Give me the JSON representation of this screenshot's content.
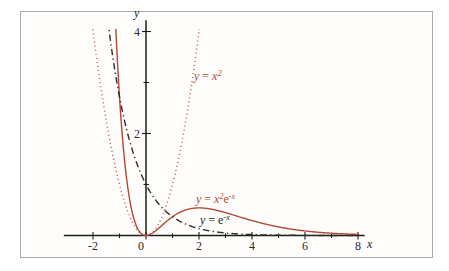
{
  "figure": {
    "background": "#ffffff",
    "frame_border_color": "#ababab",
    "axis_color": "#1d1d1b",
    "text_color": "#2b2b2b"
  },
  "chart_data": {
    "type": "line",
    "title": "",
    "xlabel": "x",
    "ylabel": "y",
    "x_axis_span": [
      -3.1,
      8.25
    ],
    "y_axis_span": [
      0,
      4.22
    ],
    "grid": false,
    "legend_position": "labels-on-curves",
    "x_ticks_major": [
      -2,
      0,
      2,
      4,
      6,
      8
    ],
    "x_tick_labels": [
      "-2",
      "0",
      "2",
      "4",
      "6",
      "8"
    ],
    "x_ticks_minor": [
      -1,
      1,
      3,
      5,
      7
    ],
    "y_ticks_major": [
      2,
      4
    ],
    "y_tick_labels": [
      "2",
      "4"
    ],
    "y_ticks_minor": [
      1,
      3
    ],
    "series": [
      {
        "name": "y = x^2",
        "formula": "x^2",
        "style": "dotted",
        "color": "#c05a40",
        "domain": [
          -2.03,
          2.03
        ],
        "label": {
          "segments": [
            {
              "text": "y",
              "italic": true
            },
            {
              "text": " = ",
              "italic": false
            },
            {
              "text": "x",
              "italic": true
            },
            {
              "text": "2",
              "italic": true,
              "sup": true
            }
          ],
          "color": "#b44a33",
          "anchor_px": [
            194,
            67
          ]
        }
      },
      {
        "name": "y = x^2 e^-x",
        "formula": "x^2*e^-x",
        "style": "solid",
        "color": "#b04936",
        "domain": [
          -1.16,
          8.05
        ],
        "label": {
          "segments": [
            {
              "text": "y",
              "italic": true
            },
            {
              "text": " = ",
              "italic": false
            },
            {
              "text": "x",
              "italic": true
            },
            {
              "text": "2",
              "italic": true,
              "sup": true
            },
            {
              "text": "e",
              "italic": false
            },
            {
              "text": "-x",
              "italic": true,
              "sup": true
            }
          ],
          "color": "#b44a33",
          "anchor_px": [
            196,
            190
          ]
        }
      },
      {
        "name": "y = e^-x",
        "formula": "e^-x",
        "style": "dashdot",
        "color": "#2e2c29",
        "domain": [
          -1.44,
          8.05
        ],
        "label": {
          "segments": [
            {
              "text": "y",
              "italic": true
            },
            {
              "text": " = ",
              "italic": false
            },
            {
              "text": "e",
              "italic": false
            },
            {
              "text": "-x",
              "italic": true,
              "sup": true
            }
          ],
          "color": "#262626",
          "anchor_px": [
            200,
            211
          ]
        }
      }
    ],
    "key_points": [
      {
        "series": "y = e^-x",
        "label": "y-intercept",
        "x": 0,
        "y": 1
      },
      {
        "series": "y = x^2 e^-x",
        "label": "local maximum",
        "x": 2,
        "y": 0.54
      },
      {
        "series": "y = x^2 e^-x",
        "label": "minimum at origin",
        "x": 0,
        "y": 0
      }
    ]
  }
}
